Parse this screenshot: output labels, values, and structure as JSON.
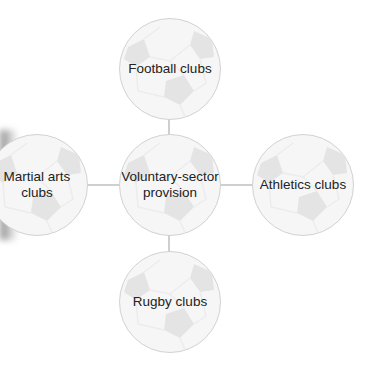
{
  "diagram": {
    "type": "hub-and-spoke",
    "center": {
      "label": "Voluntary-sector provision",
      "lines": [
        "Voluntary-sector",
        "provision"
      ]
    },
    "spokes": [
      {
        "position": "top",
        "label": "Football clubs",
        "lines": [
          "Football clubs"
        ]
      },
      {
        "position": "left",
        "label": "Martial arts clubs",
        "lines": [
          "Martial arts",
          "clubs"
        ]
      },
      {
        "position": "right",
        "label": "Athletics clubs",
        "lines": [
          "Athletics clubs"
        ]
      },
      {
        "position": "bottom",
        "label": "Rugby clubs",
        "lines": [
          "Rugby clubs"
        ]
      }
    ],
    "node_style": "football-ball",
    "colors": {
      "node_fill": "#f6f6f6",
      "patch": "#e4e4e4",
      "border": "#d2d2d2",
      "connector": "#cfcfcf",
      "text": "#222222"
    }
  }
}
